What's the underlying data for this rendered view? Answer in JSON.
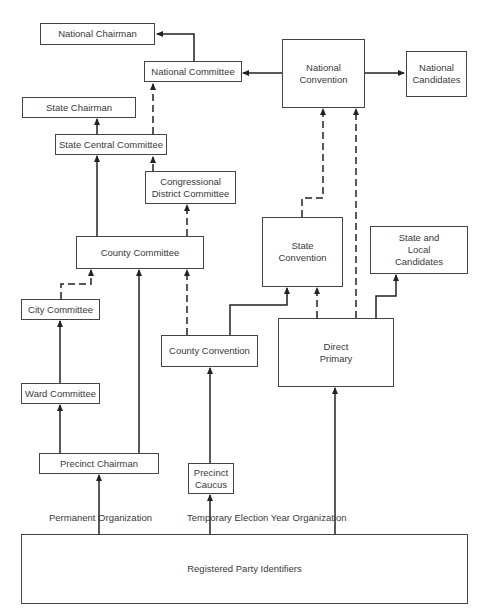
{
  "diagram": {
    "nodes": {
      "national_chairman": "National Chairman",
      "national_committee": "National Committee",
      "national_convention": "National\nConvention",
      "national_candidates": "National\nCandidates",
      "state_chairman": "State Chairman",
      "state_central_committee": "State Central Committee",
      "congressional_district_committee": "Congressional\nDistrict Committee",
      "county_committee": "County Committee",
      "state_convention": "State\nConvention",
      "state_local_candidates": "State and\nLocal\nCandidates",
      "city_committee": "City Committee",
      "county_convention": "County Convention",
      "direct_primary": "Direct\nPrimary",
      "ward_committee": "Ward Committee",
      "precinct_chairman": "Precinct Chairman",
      "precinct_caucus": "Precinct\nCaucus",
      "registered_party_identifiers": "Registered Party Identifiers"
    },
    "labels": {
      "permanent": "Permanent Organization",
      "temporary": "Temporary Election Year Organization"
    },
    "colors": {
      "line": "#222222",
      "border": "#444444",
      "text": "#3a3a3a"
    }
  }
}
